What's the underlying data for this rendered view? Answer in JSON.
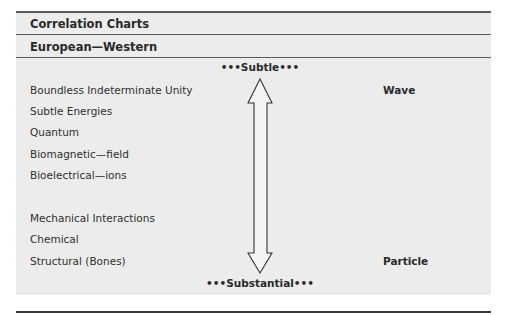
{
  "header": {
    "title": "Correlation Charts",
    "subtitle": "European—Western"
  },
  "scale": {
    "top_pole": "•••Subtle•••",
    "bottom_pole": "•••Substantial•••",
    "arrow": "double-headed-vertical-arrow"
  },
  "levels": [
    "Boundless Indeterminate Unity",
    "Subtle Energies",
    "Quantum",
    "Biomagnetic—field",
    "Bioelectrical—ions",
    "Mechanical Interactions",
    "Chemical",
    "Structural (Bones)"
  ],
  "side_labels": {
    "top": "Wave",
    "bottom": "Particle"
  }
}
